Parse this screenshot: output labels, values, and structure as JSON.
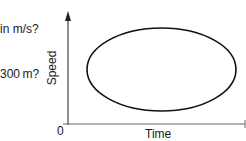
{
  "question_fragments": {
    "line1": "in m/s?",
    "line2": "300 m?"
  },
  "graph": {
    "x_axis_label": "Time",
    "y_axis_label": "Speed",
    "origin_label": "0",
    "curve_shape": "ellipse",
    "stroke_color": "#1a1a1a",
    "axis_color": "#555555"
  }
}
